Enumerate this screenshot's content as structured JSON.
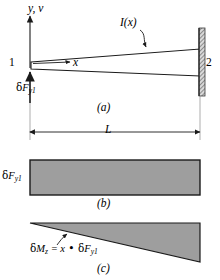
{
  "figure": {
    "panels": [
      {
        "id": "a",
        "caption": "(a)",
        "description": "Tapered beam from node 1 to node 2 with variable second moment of area I(x), length L, and applied virtual force delta F y1 at node 1"
      },
      {
        "id": "b",
        "caption": "(b)",
        "description": "Constant shear diagram of magnitude delta F y1"
      },
      {
        "id": "c",
        "caption": "(c)",
        "description": "Linear bending moment diagram delta M z = x times delta F y1"
      }
    ]
  },
  "panel_a": {
    "axis_label": "y, v",
    "inertia_label": "I(x)",
    "x_axis_label": "x",
    "node_left": "1",
    "node_right": "2",
    "force_label_greek": "δ",
    "force_label_main": "F",
    "force_label_sub": "y1",
    "caption": "(a)",
    "length_label": "L"
  },
  "panel_b": {
    "value_label_greek": "δ",
    "value_label_main": "F",
    "value_label_sub": "y1",
    "caption": "(b)"
  },
  "panel_c": {
    "moment_greek": "δ",
    "moment_main": "M",
    "moment_sub": "z",
    "equals": " = ",
    "x_term": "x",
    "dot": " • ",
    "force_greek": "δ",
    "force_main": "F",
    "force_sub": "y1",
    "caption": "(c)"
  },
  "colors": {
    "fill_gray": "#9e9e9e",
    "stroke": "#1a1a1a",
    "wall_hatch": "#6b6b6b",
    "background": "#ffffff"
  }
}
